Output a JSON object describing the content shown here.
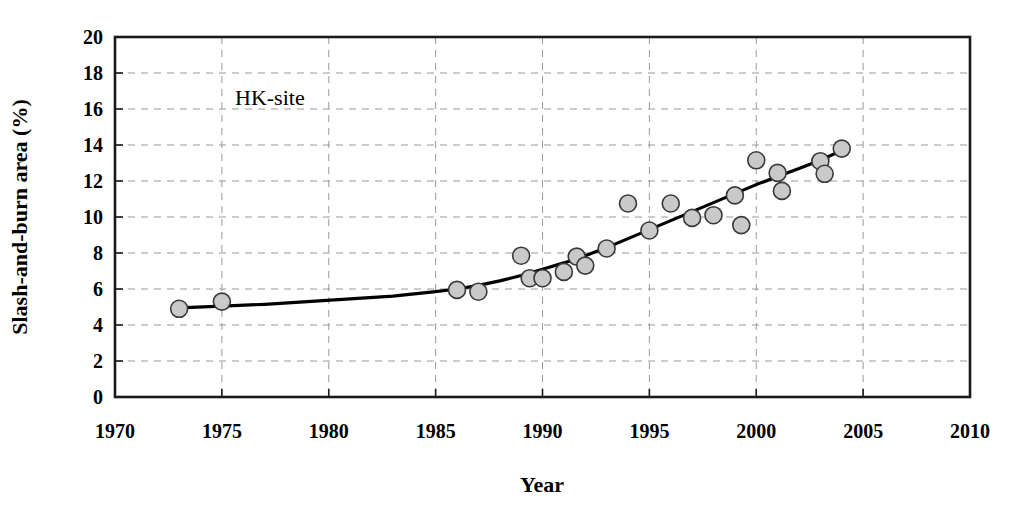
{
  "chart_data": {
    "type": "scatter",
    "title": "",
    "annotation": "HK-site",
    "xlabel": "Year",
    "ylabel": "Slash-and-burn area (%)",
    "xlim": [
      1970,
      2010
    ],
    "ylim": [
      0,
      20
    ],
    "xticks": [
      1970,
      1975,
      1980,
      1985,
      1990,
      1995,
      2000,
      2005,
      2010
    ],
    "yticks": [
      0,
      2,
      4,
      6,
      8,
      10,
      12,
      14,
      16,
      18,
      20
    ],
    "grid": true,
    "grid_style": "dashed",
    "legend": "none",
    "series": [
      {
        "name": "Slash-and-burn area observations",
        "marker": "circle",
        "marker_fill": "#c9c9c9",
        "marker_edge": "#3a3a3a",
        "points": [
          {
            "x": 1973,
            "y": 4.9
          },
          {
            "x": 1975,
            "y": 5.3
          },
          {
            "x": 1986,
            "y": 5.95
          },
          {
            "x": 1987,
            "y": 5.85
          },
          {
            "x": 1989,
            "y": 7.85
          },
          {
            "x": 1989.4,
            "y": 6.6
          },
          {
            "x": 1990,
            "y": 6.6
          },
          {
            "x": 1991,
            "y": 6.95
          },
          {
            "x": 1991.6,
            "y": 7.8
          },
          {
            "x": 1992,
            "y": 7.3
          },
          {
            "x": 1993,
            "y": 8.25
          },
          {
            "x": 1994,
            "y": 10.75
          },
          {
            "x": 1995,
            "y": 9.25
          },
          {
            "x": 1996,
            "y": 10.75
          },
          {
            "x": 1997,
            "y": 9.95
          },
          {
            "x": 1998,
            "y": 10.1
          },
          {
            "x": 1999,
            "y": 11.2
          },
          {
            "x": 1999.3,
            "y": 9.55
          },
          {
            "x": 2000,
            "y": 13.15
          },
          {
            "x": 2001,
            "y": 12.45
          },
          {
            "x": 2001.2,
            "y": 11.45
          },
          {
            "x": 2003,
            "y": 13.1
          },
          {
            "x": 2003.2,
            "y": 12.4
          },
          {
            "x": 2004,
            "y": 13.8
          }
        ]
      },
      {
        "name": "Fitted trend curve",
        "type": "line",
        "color": "#000000",
        "points": [
          {
            "x": 1973,
            "y": 4.95
          },
          {
            "x": 1975,
            "y": 5.05
          },
          {
            "x": 1977,
            "y": 5.15
          },
          {
            "x": 1979,
            "y": 5.3
          },
          {
            "x": 1981,
            "y": 5.45
          },
          {
            "x": 1983,
            "y": 5.6
          },
          {
            "x": 1985,
            "y": 5.85
          },
          {
            "x": 1986,
            "y": 6.0
          },
          {
            "x": 1987,
            "y": 6.2
          },
          {
            "x": 1988,
            "y": 6.45
          },
          {
            "x": 1989,
            "y": 6.75
          },
          {
            "x": 1990,
            "y": 7.1
          },
          {
            "x": 1991,
            "y": 7.45
          },
          {
            "x": 1992,
            "y": 7.85
          },
          {
            "x": 1993,
            "y": 8.3
          },
          {
            "x": 1994,
            "y": 8.8
          },
          {
            "x": 1995,
            "y": 9.3
          },
          {
            "x": 1996,
            "y": 9.8
          },
          {
            "x": 1997,
            "y": 10.3
          },
          {
            "x": 1998,
            "y": 10.8
          },
          {
            "x": 1999,
            "y": 11.3
          },
          {
            "x": 2000,
            "y": 11.8
          },
          {
            "x": 2001,
            "y": 12.25
          },
          {
            "x": 2002,
            "y": 12.7
          },
          {
            "x": 2003,
            "y": 13.15
          },
          {
            "x": 2004,
            "y": 13.7
          }
        ]
      }
    ]
  },
  "plot": {
    "left_px": 115,
    "right_px": 970,
    "top_px": 37,
    "bottom_px": 397
  }
}
